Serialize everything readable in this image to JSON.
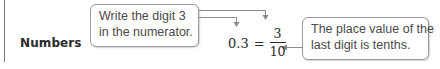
{
  "section": {
    "label": "Numbers"
  },
  "callouts": [
    {
      "lines": [
        "Write the digit 3",
        "in the numerator."
      ]
    },
    {
      "lines": [
        "The place value of the",
        "last digit is tenths."
      ]
    }
  ],
  "equation": {
    "lhs": "0.3",
    "sign": "=",
    "numerator": "3",
    "denominator": "10"
  },
  "colors": {
    "text": "#333333",
    "callout_border": "#9a9a9a",
    "arrow": "#8a8a8a"
  }
}
